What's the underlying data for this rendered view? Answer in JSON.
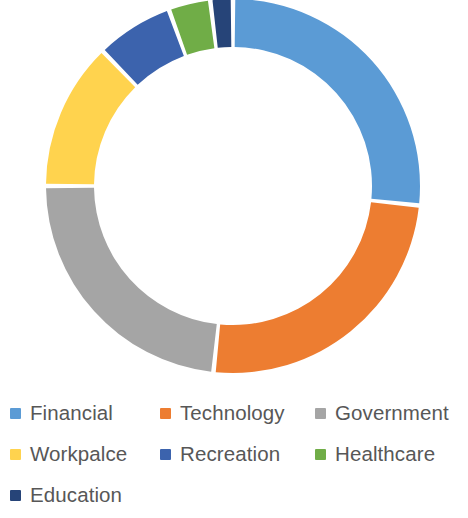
{
  "chart_data": {
    "type": "pie",
    "variant": "doughnut",
    "title": "",
    "subtitle": "",
    "xlabel": "",
    "ylabel": "",
    "grid": false,
    "legend_position": "bottom",
    "legend_columns": 3,
    "start_angle_deg": 0,
    "direction": "clockwise",
    "center": {
      "x": 233,
      "y": 186
    },
    "outer_radius": 187,
    "inner_radius": 139,
    "slice_gap_deg": 1.4,
    "categories": [
      "Financial",
      "Technology",
      "Government",
      "Workpalce",
      "Recreation",
      "Healthcare",
      "Education"
    ],
    "values": [
      26.7,
      25.0,
      23.3,
      12.8,
      6.7,
      3.6,
      1.9
    ],
    "units": "percent",
    "colors": [
      "#5B9BD5",
      "#ED7D31",
      "#A5A5A5",
      "#FFD34E",
      "#3C63AD",
      "#70AD47",
      "#264478"
    ],
    "series": [
      {
        "name": "Sectors",
        "values": [
          26.7,
          25.0,
          23.3,
          12.8,
          6.7,
          3.6,
          1.9
        ]
      }
    ],
    "slices": [
      {
        "label": "Financial",
        "value": 26.7,
        "color": "#5B9BD5",
        "start_deg": 0.0,
        "end_deg": 96.0
      },
      {
        "label": "Technology",
        "value": 25.0,
        "color": "#ED7D31",
        "start_deg": 96.0,
        "end_deg": 186.0
      },
      {
        "label": "Government",
        "value": 23.3,
        "color": "#A5A5A5",
        "start_deg": 186.0,
        "end_deg": 270.0
      },
      {
        "label": "Workpalce",
        "value": 12.8,
        "color": "#FFD34E",
        "start_deg": 270.0,
        "end_deg": 316.0
      },
      {
        "label": "Recreation",
        "value": 6.7,
        "color": "#3C63AD",
        "start_deg": 316.0,
        "end_deg": 340.0
      },
      {
        "label": "Healthcare",
        "value": 3.6,
        "color": "#70AD47",
        "start_deg": 340.0,
        "end_deg": 353.0
      },
      {
        "label": "Education",
        "value": 1.9,
        "color": "#264478",
        "start_deg": 353.0,
        "end_deg": 360.0
      }
    ]
  },
  "legend": {
    "items": [
      {
        "label": "Financial",
        "color": "#5B9BD5"
      },
      {
        "label": "Technology",
        "color": "#ED7D31"
      },
      {
        "label": "Government",
        "color": "#A5A5A5"
      },
      {
        "label": "Workpalce",
        "color": "#FFD34E"
      },
      {
        "label": "Recreation",
        "color": "#3C63AD"
      },
      {
        "label": "Healthcare",
        "color": "#70AD47"
      },
      {
        "label": "Education",
        "color": "#264478"
      }
    ]
  }
}
